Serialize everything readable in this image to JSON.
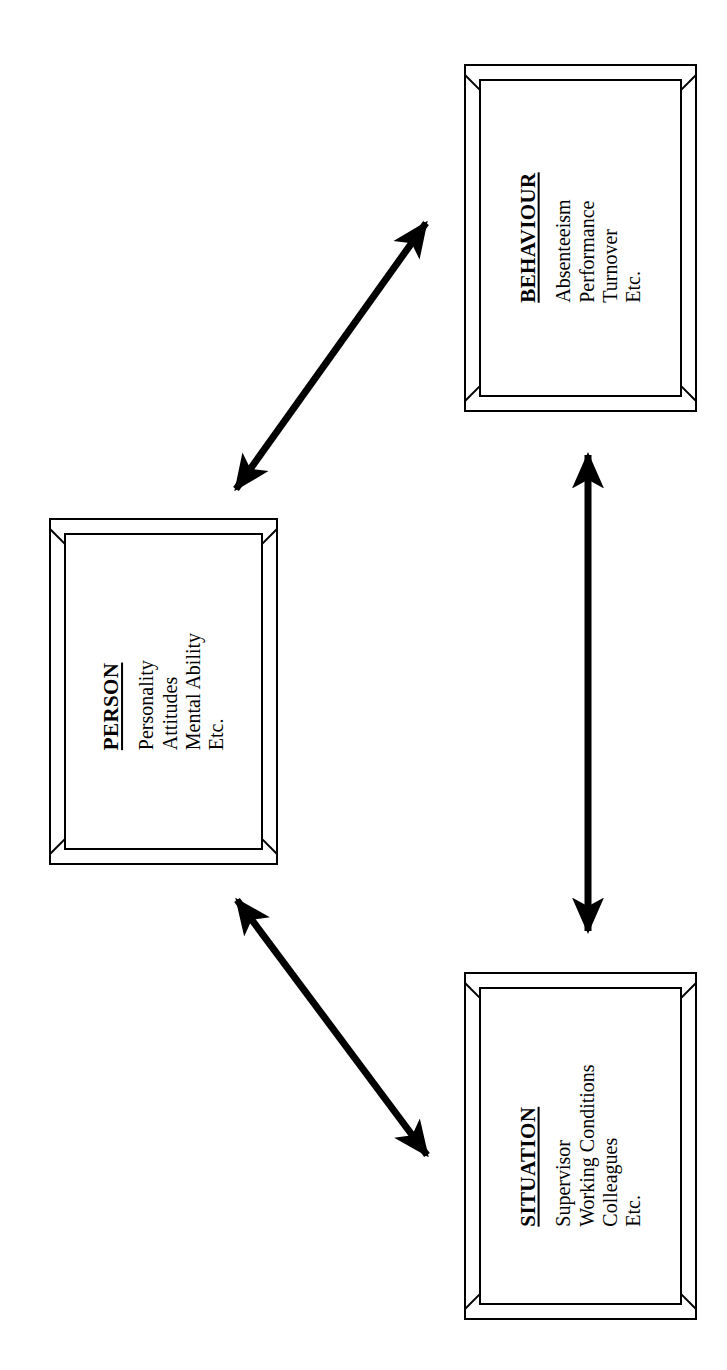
{
  "diagram": {
    "background_color": "#ffffff",
    "stroke_color": "#000000",
    "orientation": "text rotated 90 degrees counter-clockwise",
    "boxes": [
      {
        "id": "behaviour",
        "title": "BEHAVIOUR",
        "items": [
          "Absenteeism",
          "Performance",
          "Turnover",
          "Etc."
        ]
      },
      {
        "id": "person",
        "title": "PERSON",
        "items": [
          "Personality",
          "Attitudes",
          "Mental Ability",
          "Etc."
        ]
      },
      {
        "id": "situation",
        "title": "SITUATION",
        "items": [
          "Supervisor",
          "Working Conditions",
          "Colleagues",
          "Etc."
        ]
      }
    ],
    "connectors": [
      {
        "id": "person-behaviour",
        "from": "person",
        "to": "behaviour",
        "style": "double-headed-arrow"
      },
      {
        "id": "behaviour-situation",
        "from": "behaviour",
        "to": "situation",
        "style": "double-headed-arrow"
      },
      {
        "id": "person-situation",
        "from": "person",
        "to": "situation",
        "style": "double-headed-arrow"
      }
    ]
  }
}
